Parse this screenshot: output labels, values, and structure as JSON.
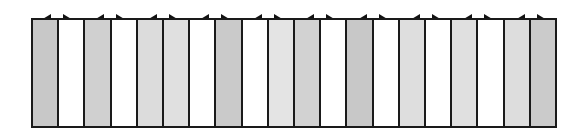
{
  "diagram": {
    "arrow_count": 10,
    "arrow_glyph": "left-right-half-arrow",
    "colors": {
      "border": "#1a1a1a",
      "white": "#ffffff",
      "light": "#e2e2e2",
      "medium": "#d2d2d2",
      "dark": "#c4c4c4"
    },
    "panels": [
      {
        "fill": "#c8c8c8"
      },
      {
        "fill": "#ffffff"
      },
      {
        "fill": "#d0d0d0"
      },
      {
        "fill": "#ffffff"
      },
      {
        "fill": "#dcdcdc"
      },
      {
        "fill": "#e0e0e0"
      },
      {
        "fill": "#ffffff"
      },
      {
        "fill": "#cacaca"
      },
      {
        "fill": "#ffffff"
      },
      {
        "fill": "#e4e4e4"
      },
      {
        "fill": "#d2d2d2"
      },
      {
        "fill": "#ffffff"
      },
      {
        "fill": "#c8c8c8"
      },
      {
        "fill": "#ffffff"
      },
      {
        "fill": "#dedede"
      },
      {
        "fill": "#ffffff"
      },
      {
        "fill": "#e0e0e0"
      },
      {
        "fill": "#ffffff"
      },
      {
        "fill": "#dddddd"
      },
      {
        "fill": "#cbcbcb"
      }
    ]
  }
}
